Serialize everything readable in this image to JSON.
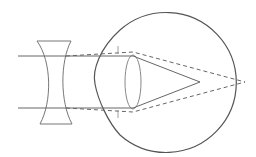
{
  "diagram": {
    "colors": {
      "background": "#ffffff",
      "eye_outline": "#555555",
      "lens_outline": "#777777",
      "ray_solid": "#666666",
      "ray_dashed": "#666666"
    },
    "elements": {
      "concave_lens": "concave-lens",
      "eyeball": "eyeball",
      "cornea": "cornea",
      "crystalline_lens": "crystalline-lens",
      "incoming_rays": 2,
      "focal_point_uncorrected": "in front of retina",
      "focal_point_corrected": "on retina"
    }
  }
}
